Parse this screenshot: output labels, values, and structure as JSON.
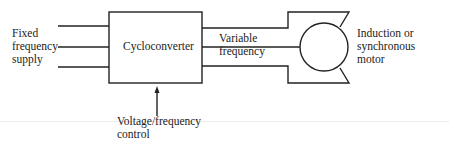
{
  "diagram": {
    "type": "block-diagram",
    "input": {
      "label_lines": [
        "Fixed",
        "frequency",
        "supply"
      ]
    },
    "block": {
      "label": "Cycloconverter"
    },
    "output": {
      "label_lines": [
        "Variable",
        "frequency"
      ]
    },
    "motor": {
      "label_lines": [
        "Induction or",
        "synchronous",
        "motor"
      ]
    },
    "control": {
      "label_lines": [
        "Voltage/frequency",
        "control"
      ]
    },
    "colors": {
      "line": "#222222",
      "background": "#ffffff"
    }
  }
}
